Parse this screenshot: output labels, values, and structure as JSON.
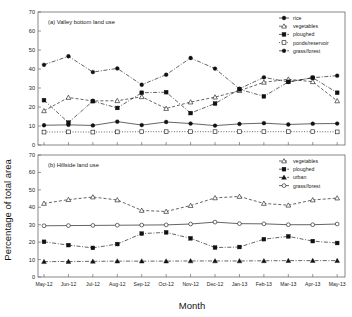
{
  "figure": {
    "xlabel": "Month",
    "ylabel": "Percentage of total area"
  },
  "chart_data": [
    {
      "type": "line",
      "title": "(a) Valley bottom land use",
      "xlabel": "Month",
      "ylabel": "Percentage of total area",
      "ylim": [
        0,
        70
      ],
      "yticks": [
        0,
        10,
        20,
        30,
        40,
        50,
        60,
        70
      ],
      "grid": false,
      "legend_position": "top-right",
      "categories": [
        "May-12",
        "Jun-12",
        "Jul-12",
        "Aug-12",
        "Sep-12",
        "Oct-12",
        "Nov-12",
        "Dec-12",
        "Jan-13",
        "Feb-13",
        "Mar-13",
        "Apr-13",
        "May-13"
      ],
      "series": [
        {
          "name": "rice",
          "marker": "filled-circle",
          "line": "solid",
          "values": [
            10.4,
            10.6,
            10.3,
            12.3,
            10.5,
            12.1,
            11.3,
            10.2,
            11.1,
            11.5,
            10.8,
            11.2,
            11.3
          ]
        },
        {
          "name": "vegetables",
          "marker": "open-triangle",
          "line": "dashed",
          "values": [
            18.0,
            25.0,
            23.2,
            23.3,
            25.4,
            19.2,
            22.6,
            25.2,
            28.6,
            33.0,
            34.6,
            33.3,
            23.2
          ]
        },
        {
          "name": "ploughed",
          "marker": "filled-square",
          "line": "dash-dot",
          "values": [
            23.6,
            11.8,
            23.1,
            19.5,
            27.5,
            27.8,
            16.8,
            21.8,
            29.3,
            25.6,
            33.2,
            35.4,
            27.5
          ]
        },
        {
          "name": "ponds/reservoir",
          "marker": "open-square",
          "line": "dotted",
          "values": [
            6.8,
            6.9,
            6.8,
            6.9,
            7.0,
            7.0,
            7.0,
            7.0,
            7.0,
            7.0,
            7.0,
            7.0,
            6.9
          ]
        },
        {
          "name": "grass/forest",
          "marker": "dotted-circle",
          "line": "dash-dot",
          "values": [
            42.2,
            46.7,
            38.4,
            40.3,
            31.7,
            37.0,
            45.8,
            40.2,
            29.6,
            35.6,
            33.2,
            35.4,
            36.5
          ]
        }
      ]
    },
    {
      "type": "line",
      "title": "(b) Hillside land use",
      "xlabel": "Month",
      "ylabel": "Percentage of total area",
      "ylim": [
        0,
        70
      ],
      "yticks": [
        0,
        10,
        20,
        30,
        40,
        50,
        60,
        70
      ],
      "grid": false,
      "legend_position": "top-right",
      "categories": [
        "May-12",
        "Jun-12",
        "Jul-12",
        "Aug-12",
        "Sep-12",
        "Oct-12",
        "Nov-12",
        "Dec-12",
        "Jan-13",
        "Feb-13",
        "Mar-13",
        "Apr-13",
        "May-13"
      ],
      "series": [
        {
          "name": "vegetables",
          "marker": "open-triangle",
          "line": "dashed",
          "values": [
            42.2,
            44.4,
            45.9,
            44.2,
            38.2,
            37.6,
            41.0,
            45.4,
            46.2,
            42.2,
            41.2,
            44.2,
            45.3
          ]
        },
        {
          "name": "ploughed",
          "marker": "filled-square",
          "line": "dash-dot",
          "values": [
            20.2,
            18.3,
            16.7,
            18.9,
            24.9,
            25.6,
            22.2,
            16.9,
            17.2,
            21.7,
            23.3,
            20.6,
            19.5
          ]
        },
        {
          "name": "urban",
          "marker": "filled-triangle",
          "line": "dash-dot",
          "values": [
            8.8,
            8.9,
            9.0,
            9.1,
            9.1,
            9.1,
            9.2,
            9.2,
            9.2,
            9.3,
            9.4,
            9.4,
            9.4
          ]
        },
        {
          "name": "grass/forest",
          "marker": "open-circle",
          "line": "solid",
          "values": [
            29.4,
            29.5,
            29.6,
            29.7,
            29.8,
            29.9,
            30.4,
            31.5,
            30.6,
            30.5,
            30.0,
            30.0,
            30.4
          ]
        }
      ]
    }
  ]
}
